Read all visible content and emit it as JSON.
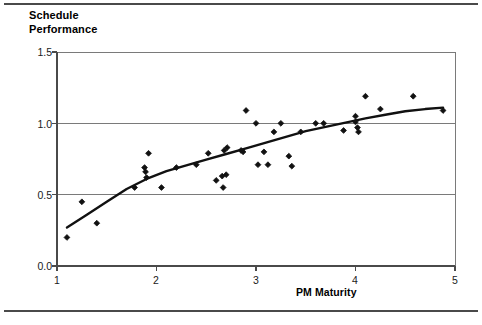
{
  "figure": {
    "frame_color": "#4a4a4a",
    "background": "#ffffff"
  },
  "axis_titles": {
    "y": "Schedule\nPerformance",
    "x": "PM Maturity"
  },
  "ticks": {
    "y": [
      "1.5",
      "1.0",
      "0.5",
      "0.0"
    ],
    "x": [
      "1",
      "2",
      "3",
      "4",
      "5"
    ]
  },
  "chart_data": {
    "type": "scatter",
    "title": "",
    "xlabel": "PM Maturity",
    "ylabel": "Schedule Performance",
    "xlim": [
      1,
      5
    ],
    "ylim": [
      0.0,
      1.5
    ],
    "xticks": [
      1,
      2,
      3,
      4,
      5
    ],
    "yticks": [
      0.0,
      0.5,
      1.0,
      1.5
    ],
    "grid": "horizontal",
    "legend": "none",
    "marker": "diamond",
    "marker_color": "#111111",
    "line_color": "#111111",
    "series": [
      {
        "name": "Projects",
        "type": "scatter",
        "points": [
          [
            1.1,
            0.2
          ],
          [
            1.25,
            0.45
          ],
          [
            1.4,
            0.3
          ],
          [
            1.78,
            0.55
          ],
          [
            1.88,
            0.69
          ],
          [
            1.89,
            0.66
          ],
          [
            1.9,
            0.62
          ],
          [
            1.92,
            0.79
          ],
          [
            2.05,
            0.55
          ],
          [
            2.2,
            0.69
          ],
          [
            2.4,
            0.71
          ],
          [
            2.52,
            0.79
          ],
          [
            2.6,
            0.6
          ],
          [
            2.66,
            0.63
          ],
          [
            2.67,
            0.55
          ],
          [
            2.68,
            0.81
          ],
          [
            2.7,
            0.64
          ],
          [
            2.71,
            0.83
          ],
          [
            2.85,
            0.81
          ],
          [
            2.87,
            0.8
          ],
          [
            2.9,
            1.09
          ],
          [
            3.0,
            1.0
          ],
          [
            3.02,
            0.71
          ],
          [
            3.08,
            0.8
          ],
          [
            3.12,
            0.71
          ],
          [
            3.18,
            0.94
          ],
          [
            3.25,
            1.0
          ],
          [
            3.33,
            0.77
          ],
          [
            3.36,
            0.7
          ],
          [
            3.45,
            0.94
          ],
          [
            3.6,
            1.0
          ],
          [
            3.68,
            1.0
          ],
          [
            3.88,
            0.95
          ],
          [
            4.0,
            1.05
          ],
          [
            4.0,
            1.01
          ],
          [
            4.02,
            0.97
          ],
          [
            4.03,
            0.94
          ],
          [
            4.1,
            1.19
          ],
          [
            4.25,
            1.1
          ],
          [
            4.58,
            1.19
          ],
          [
            4.88,
            1.09
          ]
        ]
      },
      {
        "name": "Fitted trend",
        "type": "line",
        "points": [
          [
            1.1,
            0.27
          ],
          [
            1.3,
            0.36
          ],
          [
            1.5,
            0.45
          ],
          [
            1.7,
            0.54
          ],
          [
            1.9,
            0.61
          ],
          [
            2.1,
            0.665
          ],
          [
            2.3,
            0.705
          ],
          [
            2.5,
            0.745
          ],
          [
            2.7,
            0.785
          ],
          [
            2.9,
            0.825
          ],
          [
            3.1,
            0.865
          ],
          [
            3.3,
            0.905
          ],
          [
            3.5,
            0.945
          ],
          [
            3.7,
            0.975
          ],
          [
            3.9,
            1.005
          ],
          [
            4.1,
            1.035
          ],
          [
            4.3,
            1.06
          ],
          [
            4.5,
            1.085
          ],
          [
            4.7,
            1.1
          ],
          [
            4.88,
            1.11
          ]
        ]
      }
    ]
  },
  "geometry": {
    "plot_left": 57,
    "plot_right": 455,
    "plot_top": 52,
    "plot_bottom": 266
  }
}
